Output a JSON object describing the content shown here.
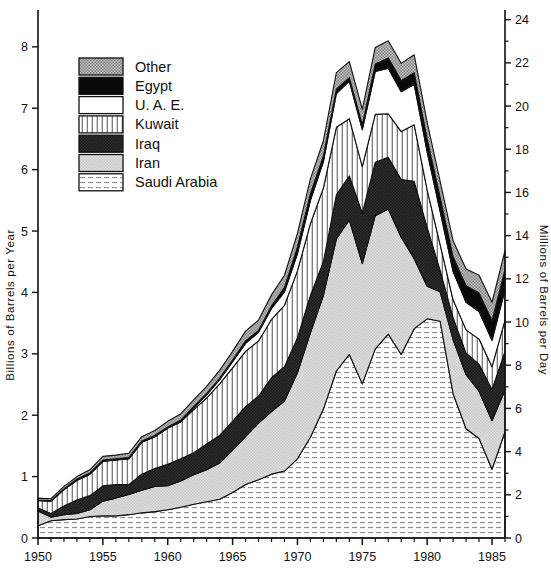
{
  "chart_data": {
    "type": "area",
    "title": "",
    "subtitle": "",
    "stacked": true,
    "xlabel": "",
    "ylabel": "Billions of Barrels per Year",
    "ylabel_right": "Millions of Barrels per Day",
    "xlim": [
      1950,
      1986
    ],
    "ylim": [
      0,
      8.6
    ],
    "ylim_right": [
      0,
      24
    ],
    "grid": false,
    "legend_position": "top-left",
    "x_major_ticks": [
      1950,
      1955,
      1960,
      1965,
      1970,
      1975,
      1980,
      1985
    ],
    "x_tick_labels": [
      "1950",
      "1955",
      "1960",
      "1965",
      "1970",
      "1975",
      "1980",
      "1985"
    ],
    "x_minor_tick_step": 1,
    "y_major_ticks": [
      0,
      1,
      2,
      3,
      4,
      5,
      6,
      7,
      8
    ],
    "y_tick_labels": [
      "0",
      "1",
      "2",
      "3",
      "4",
      "5",
      "6",
      "7",
      "8"
    ],
    "y_right_major_ticks": [
      0,
      2,
      4,
      6,
      8,
      10,
      12,
      14,
      16,
      18,
      20,
      22,
      24
    ],
    "y_right_tick_labels": [
      "0",
      "2",
      "4",
      "6",
      "8",
      "10",
      "12",
      "14",
      "16",
      "18",
      "20",
      "22",
      "24"
    ],
    "y_right_minor_tick_step": 1,
    "right_axis_conversion_note": "Billions of barrels per year x 2.7397 = millions of barrels per day",
    "x": [
      1950,
      1951,
      1952,
      1953,
      1954,
      1955,
      1956,
      1957,
      1958,
      1959,
      1960,
      1961,
      1962,
      1963,
      1964,
      1965,
      1966,
      1967,
      1968,
      1969,
      1970,
      1971,
      1972,
      1973,
      1974,
      1975,
      1976,
      1977,
      1978,
      1979,
      1980,
      1981,
      1982,
      1983,
      1984,
      1985,
      1986
    ],
    "series": [
      {
        "name": "Saudi Arabia",
        "pattern": "horizontal-dash",
        "color": "#f2f2f2",
        "values": [
          0.2,
          0.28,
          0.3,
          0.31,
          0.35,
          0.36,
          0.36,
          0.38,
          0.41,
          0.43,
          0.46,
          0.5,
          0.55,
          0.59,
          0.63,
          0.74,
          0.87,
          0.95,
          1.04,
          1.09,
          1.29,
          1.64,
          2.1,
          2.72,
          2.99,
          2.51,
          3.08,
          3.32,
          2.99,
          3.41,
          3.57,
          3.53,
          2.35,
          1.78,
          1.62,
          1.12,
          1.73
        ]
      },
      {
        "name": "Iran",
        "pattern": "solid-light-gray",
        "color": "#d9d9d9",
        "values": [
          0.24,
          0.06,
          0.08,
          0.09,
          0.11,
          0.24,
          0.29,
          0.33,
          0.37,
          0.41,
          0.39,
          0.43,
          0.48,
          0.52,
          0.59,
          0.69,
          0.78,
          0.92,
          1.02,
          1.14,
          1.4,
          1.7,
          1.85,
          2.15,
          2.19,
          1.96,
          2.17,
          2.04,
          1.91,
          1.14,
          0.53,
          0.48,
          0.88,
          0.88,
          0.77,
          0.79,
          0.68
        ]
      },
      {
        "name": "Iraq",
        "pattern": "solid-dark",
        "color": "#2b2b2b",
        "values": [
          0.05,
          0.06,
          0.14,
          0.22,
          0.23,
          0.25,
          0.22,
          0.16,
          0.26,
          0.29,
          0.35,
          0.36,
          0.36,
          0.42,
          0.45,
          0.47,
          0.49,
          0.44,
          0.55,
          0.56,
          0.57,
          0.61,
          0.55,
          0.72,
          0.72,
          0.82,
          0.87,
          0.84,
          0.94,
          1.26,
          0.96,
          0.35,
          0.36,
          0.35,
          0.44,
          0.51,
          0.63
        ]
      },
      {
        "name": "Kuwait",
        "pattern": "vertical-hatch",
        "color": "#ffffff",
        "values": [
          0.12,
          0.2,
          0.27,
          0.32,
          0.35,
          0.4,
          0.4,
          0.42,
          0.52,
          0.52,
          0.59,
          0.6,
          0.7,
          0.75,
          0.84,
          0.87,
          0.9,
          0.9,
          0.95,
          1.0,
          1.09,
          1.17,
          1.2,
          1.1,
          0.93,
          0.76,
          0.78,
          0.71,
          0.78,
          0.92,
          0.61,
          0.42,
          0.29,
          0.38,
          0.41,
          0.37,
          0.51
        ]
      },
      {
        "name": "U. A. E.",
        "pattern": "solid-white",
        "color": "#ffffff",
        "values": [
          0.0,
          0.0,
          0.0,
          0.0,
          0.0,
          0.0,
          0.0,
          0.0,
          0.0,
          0.0,
          0.0,
          0.01,
          0.03,
          0.05,
          0.07,
          0.1,
          0.13,
          0.14,
          0.18,
          0.22,
          0.28,
          0.38,
          0.43,
          0.55,
          0.61,
          0.6,
          0.7,
          0.74,
          0.65,
          0.66,
          0.62,
          0.54,
          0.46,
          0.45,
          0.45,
          0.43,
          0.49
        ]
      },
      {
        "name": "Egypt",
        "pattern": "solid-black",
        "color": "#0a0a0a",
        "values": [
          0.01,
          0.01,
          0.01,
          0.02,
          0.02,
          0.02,
          0.02,
          0.02,
          0.02,
          0.02,
          0.02,
          0.02,
          0.02,
          0.02,
          0.02,
          0.03,
          0.04,
          0.03,
          0.04,
          0.07,
          0.11,
          0.11,
          0.09,
          0.07,
          0.06,
          0.08,
          0.12,
          0.17,
          0.18,
          0.19,
          0.21,
          0.23,
          0.24,
          0.27,
          0.3,
          0.32,
          0.33
        ]
      },
      {
        "name": "Other",
        "pattern": "gray-stipple",
        "color": "#a8a8a8",
        "values": [
          0.03,
          0.03,
          0.04,
          0.04,
          0.05,
          0.06,
          0.06,
          0.07,
          0.07,
          0.08,
          0.09,
          0.1,
          0.11,
          0.12,
          0.13,
          0.14,
          0.16,
          0.17,
          0.18,
          0.2,
          0.22,
          0.24,
          0.25,
          0.27,
          0.26,
          0.25,
          0.27,
          0.28,
          0.28,
          0.29,
          0.27,
          0.26,
          0.26,
          0.27,
          0.29,
          0.3,
          0.31
        ]
      }
    ],
    "totals": [
      0.65,
      0.64,
      0.84,
      1.0,
      1.11,
      1.33,
      1.35,
      1.38,
      1.65,
      1.75,
      1.9,
      2.02,
      2.25,
      2.47,
      2.73,
      3.04,
      3.37,
      3.55,
      3.96,
      4.28,
      4.96,
      5.85,
      6.47,
      7.58,
      7.76,
      6.98,
      7.99,
      8.1,
      7.73,
      7.87,
      6.77,
      5.81,
      4.84,
      4.38,
      4.28,
      3.84,
      4.68
    ]
  },
  "legend": {
    "items": [
      {
        "label": "Other"
      },
      {
        "label": "Egypt"
      },
      {
        "label": "U. A. E."
      },
      {
        "label": "Kuwait"
      },
      {
        "label": "Iraq"
      },
      {
        "label": "Iran"
      },
      {
        "label": "Saudi Arabia"
      }
    ]
  }
}
